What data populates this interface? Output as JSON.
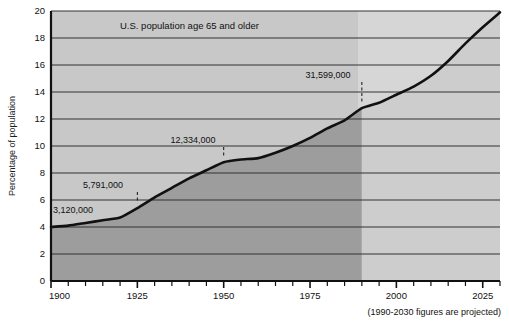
{
  "chart_data": {
    "type": "area",
    "title": "U.S. population age 65 and older",
    "xlabel": "",
    "ylabel": "Percentage of population",
    "xlim": [
      1900,
      2030
    ],
    "ylim": [
      0,
      20
    ],
    "grid": true,
    "legend": null,
    "footnote": "(1990-2030 figures are projected)",
    "x_ticks_major": [
      1900,
      1925,
      1950,
      1975,
      2000,
      2025
    ],
    "x_ticks_minor_step": 5,
    "y_ticks": [
      0,
      2,
      4,
      6,
      8,
      10,
      12,
      14,
      16,
      18,
      20
    ],
    "projection_start_year": 1990,
    "series": [
      {
        "name": "Percentage of population age 65 and older",
        "x": [
          1900,
          1905,
          1910,
          1915,
          1920,
          1925,
          1930,
          1935,
          1940,
          1945,
          1950,
          1955,
          1960,
          1965,
          1970,
          1975,
          1980,
          1985,
          1990,
          1995,
          2000,
          2005,
          2010,
          2015,
          2020,
          2025,
          2030
        ],
        "values": [
          4.0,
          4.1,
          4.3,
          4.5,
          4.7,
          5.4,
          6.2,
          6.9,
          7.6,
          8.2,
          8.8,
          9.0,
          9.1,
          9.5,
          10.0,
          10.6,
          11.3,
          11.9,
          12.8,
          13.2,
          13.8,
          14.4,
          15.2,
          16.3,
          17.6,
          18.8,
          19.9
        ]
      }
    ],
    "annotations": [
      {
        "label": "3,120,000",
        "year": 1900,
        "value": 4.0,
        "leader": false,
        "text_x": 53,
        "text_y": 213
      },
      {
        "label": "5,791,000",
        "year": 1925,
        "value": 5.4,
        "leader": true,
        "text_x": 103,
        "text_y": 188
      },
      {
        "label": "12,334,000",
        "year": 1950,
        "value": 8.8,
        "leader": true,
        "text_x": 193,
        "text_y": 143
      },
      {
        "label": "31,599,000",
        "year": 1990,
        "value": 12.8,
        "leader": true,
        "text_x": 328,
        "text_y": 78
      }
    ],
    "colors": {
      "plot_background": "#c8c8c8",
      "projection_background": "#d4d4d4",
      "area_fill_historical": "#9a9a9a",
      "line": "#111111",
      "gridline": "#333333",
      "axis": "#111111",
      "page_background": "#ffffff",
      "text": "#111111"
    }
  }
}
